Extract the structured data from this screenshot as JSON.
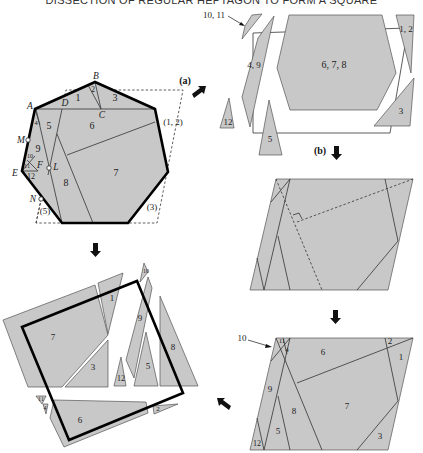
{
  "title": "DISSECTION OF REGULAR HEPTAGON TO FORM A SQUARE",
  "colors": {
    "piece_fill": "#c8c8c8",
    "outline": "#000000",
    "background": "#ffffff"
  },
  "heptagon": {
    "vertex_labels": {
      "A": "A",
      "B": "B",
      "C": "C",
      "D": "D",
      "E": "E",
      "F": "F",
      "L": "L",
      "M": "M",
      "N": "N"
    },
    "piece_labels": {
      "p1": "1",
      "p2": "2",
      "p3": "3",
      "p4": "4",
      "p5": "5",
      "p6": "6",
      "p7": "7",
      "p8": "8",
      "p9": "9",
      "p10": "10",
      "p11": "11",
      "p12": "12"
    },
    "ghost_labels": {
      "g12": "(1, 2)",
      "g3": "(3)",
      "g5": "(5)"
    }
  },
  "steps": {
    "a": "(a)",
    "b": "(b)"
  },
  "panel_a": {
    "callout": "10, 11",
    "labels": {
      "p49": "4, 9",
      "p678": "6, 7, 8",
      "p12": "1, 2",
      "p3": "3",
      "p12b": "12",
      "p5": "5"
    }
  },
  "panel_c": {
    "callout": "10",
    "labels": {
      "p11": "11",
      "p4": "4",
      "p6": "6",
      "p2": "2",
      "p1": "1",
      "p9": "9",
      "p8": "8",
      "p7": "7",
      "p5": "5",
      "p12": "12",
      "p3": "3"
    }
  },
  "panel_square": {
    "labels": {
      "p10": "10",
      "p1": "1",
      "p7": "7",
      "p9": "9",
      "p8": "8",
      "p3": "3",
      "p12": "12",
      "p5": "5",
      "p11": "11",
      "p4": "4",
      "p6": "6",
      "p2": "2"
    }
  }
}
